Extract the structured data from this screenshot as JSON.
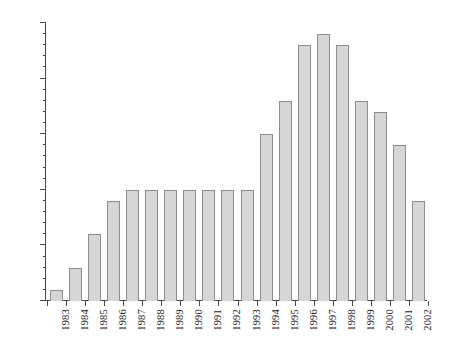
{
  "chart_data": {
    "type": "bar",
    "title": "",
    "subtitle": "",
    "xlabel": "",
    "ylabel": "",
    "categories": [
      "1983",
      "1984",
      "1985",
      "1986",
      "1987",
      "1988",
      "1989",
      "1990",
      "1991",
      "1992",
      "1993",
      "1994",
      "1995",
      "1996",
      "1997",
      "1998",
      "1999",
      "2000",
      "2001",
      "2002"
    ],
    "values": [
      1,
      3,
      6,
      9,
      10,
      10,
      10,
      10,
      10,
      10,
      10,
      15,
      18,
      23,
      24,
      23,
      18,
      17,
      14,
      9
    ],
    "ylim": [
      0,
      25
    ],
    "y_ticks_major": [
      0,
      5,
      10,
      15,
      20,
      25
    ],
    "y_tick_labels": [
      "0",
      "5",
      "10",
      "15",
      "20",
      "25"
    ],
    "y_tick_minor_step": 1,
    "grid": false,
    "legend": null,
    "legend_position": "none",
    "bar_fill_color": "#d6d6d6",
    "bar_border_color": "#8c8c8c",
    "axis_color": "#4a4a4a",
    "background_color": "#ffffff"
  }
}
